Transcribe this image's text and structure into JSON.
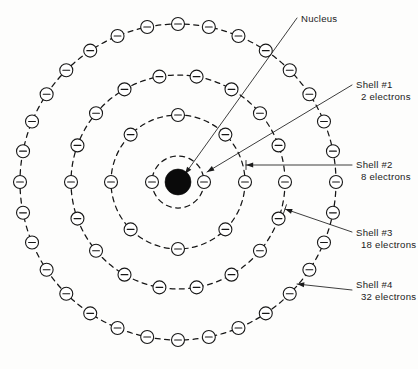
{
  "figure": {
    "kind": "bohr-atom-shell-diagram",
    "background_color": "#fdfdfc",
    "ink_color": "#161616",
    "width": 418,
    "height": 369
  },
  "nucleus": {
    "label": "Nucleus",
    "center_x": 178,
    "center_y": 182,
    "radius": 13,
    "fill": "#0a0a0a",
    "label_x": 301,
    "label_y": 22,
    "leader_from_x": 297,
    "leader_from_y": 18,
    "leader_to_x": 185,
    "leader_to_y": 174
  },
  "shells": [
    {
      "id": 1,
      "name": "Shell #1",
      "electron_count_label": "2 electrons",
      "electron_count": 2,
      "radius": 26,
      "start_angle_deg": 180,
      "label_x": 356,
      "label_y": 88,
      "label_sub_y": 100,
      "leader_from_x": 352,
      "leader_from_y": 85,
      "leader_to_x": 207,
      "leader_to_y": 172,
      "arrow": true
    },
    {
      "id": 2,
      "name": "Shell #2",
      "electron_count_label": "8 electrons",
      "electron_count": 8,
      "radius": 67,
      "start_angle_deg": 180,
      "label_x": 356,
      "label_y": 168,
      "label_sub_y": 180,
      "leader_from_x": 352,
      "leader_from_y": 165,
      "leader_to_x": 246,
      "leader_to_y": 165,
      "arrow": true,
      "tick": true
    },
    {
      "id": 3,
      "name": "Shell #3",
      "electron_count_label": "18 electrons",
      "electron_count": 18,
      "radius": 107,
      "start_angle_deg": 180,
      "label_x": 356,
      "label_y": 236,
      "label_sub_y": 248,
      "leader_from_x": 352,
      "leader_from_y": 232,
      "leader_to_x": 285,
      "leader_to_y": 209,
      "arrow": true,
      "tick": true
    },
    {
      "id": 4,
      "name": "Shell #4",
      "electron_count_label": "32 electrons",
      "electron_count": 32,
      "radius": 158,
      "start_angle_deg": 180,
      "label_x": 356,
      "label_y": 288,
      "label_sub_y": 300,
      "leader_from_x": 352,
      "leader_from_y": 290,
      "leader_to_x": 297,
      "leader_to_y": 284,
      "arrow": true
    }
  ],
  "electron": {
    "symbol": "minus",
    "radius": 6.5,
    "fill": "#ffffff",
    "stroke": "#171717"
  },
  "totals": {
    "electrons_all_shells": 60
  }
}
